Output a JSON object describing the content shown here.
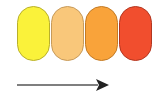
{
  "diagram": {
    "pills": [
      {
        "name": "yellow",
        "fill": "#FAF23A",
        "border": "#B9B02A"
      },
      {
        "name": "peach",
        "fill": "#F9C77A",
        "border": "#C79A5A"
      },
      {
        "name": "orange",
        "fill": "#F9A33A",
        "border": "#C27A25"
      },
      {
        "name": "red-orange",
        "fill": "#F14E2E",
        "border": "#B23620"
      }
    ],
    "arrow": {
      "direction": "right",
      "color": "#222222",
      "line_color": "#555555"
    }
  }
}
